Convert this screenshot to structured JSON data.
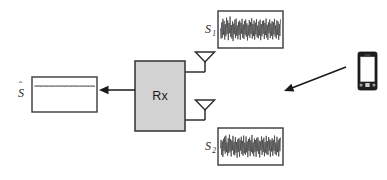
{
  "figure": {
    "background_color": "#ffffff"
  },
  "colors": {
    "rx_block_fill": "#d2d2d2",
    "rx_block_stroke": "#3c3c3c",
    "box_stroke": "#3a3a3a",
    "waveform_stroke": "#404040",
    "arrow_color": "#1a1a1a",
    "phone_body": "#1e1e1e",
    "phone_screen": "#ffffff",
    "text_color": "#1f1f1f"
  },
  "blocks": {
    "receiver": {
      "label": "Rx",
      "name": "receiver-block",
      "x": 135,
      "y": 61,
      "width": 50,
      "height": 70
    }
  },
  "signal_boxes": [
    {
      "id": "s1",
      "label": "S",
      "subscript": "1",
      "hat": "",
      "name": "signal-box-s1",
      "x": 218,
      "y": 11,
      "width": 65,
      "height": 37,
      "label_x": 205,
      "label_y": 33,
      "description": "received noisy signal at antenna 1"
    },
    {
      "id": "s2",
      "label": "S",
      "subscript": "2",
      "hat": "",
      "name": "signal-box-s2",
      "x": 218,
      "y": 128,
      "width": 65,
      "height": 37,
      "label_x": 205,
      "label_y": 150,
      "description": "received noisy signal at antenna 2"
    },
    {
      "id": "shat",
      "label": "S",
      "subscript": "",
      "hat": "ˆ",
      "name": "signal-box-s-hat",
      "x": 32,
      "y": 77,
      "width": 65,
      "height": 35,
      "label_x": 18,
      "label_y": 97,
      "description": "estimated source signal output"
    }
  ],
  "antennas": [
    {
      "id": "antenna-1",
      "name": "antenna-upper",
      "x": 205,
      "y": 52
    },
    {
      "id": "antenna-2",
      "name": "antenna-lower",
      "x": 205,
      "y": 100
    }
  ],
  "arrows": [
    {
      "id": "output-arrow",
      "name": "output-arrow",
      "from_x": 135,
      "from_y": 90,
      "to_x": 99,
      "to_y": 90,
      "width": 1.5,
      "description": "Rx output to estimated signal box"
    },
    {
      "id": "transmit-arrow",
      "name": "transmission-arrow",
      "from_x": 346,
      "from_y": 67,
      "to_x": 284,
      "to_y": 91,
      "width": 1.6,
      "description": "wireless transmission from mobile device"
    }
  ],
  "devices": [
    {
      "id": "mobile-phone",
      "name": "mobile-phone-icon",
      "x": 358,
      "y": 52,
      "width": 19,
      "height": 38,
      "description": "transmitting smartphone"
    }
  ],
  "chart_data": {
    "type": "line",
    "xlabel": "",
    "ylabel": "",
    "grid": false,
    "legend": "none",
    "series": [
      {
        "name": "S1",
        "box": "s1",
        "amplitude": 1.0,
        "samples": [
          0.05,
          -0.62,
          0.48,
          -0.55,
          0.72,
          -0.35,
          0.58,
          -0.68,
          0.35,
          -0.45,
          0.8,
          -0.3,
          0.62,
          -0.72,
          0.44,
          -0.25,
          0.88,
          -0.5,
          0.3,
          -0.62,
          0.55,
          -0.78,
          0.4,
          -0.32,
          0.66,
          -0.58,
          0.74,
          -0.42,
          0.28,
          -0.66,
          0.52,
          -0.38,
          0.6,
          -0.7,
          0.46,
          -0.28,
          0.72,
          -0.55,
          0.34,
          -0.64,
          0.58,
          -0.36,
          0.68,
          -0.48,
          0.42,
          -0.74,
          0.3,
          -0.4,
          0.64,
          -0.56,
          0.5,
          -0.3,
          0.76,
          -0.62,
          0.38,
          -0.44,
          0.6,
          -0.68,
          0.46,
          -0.34,
          0.7,
          -0.52,
          0.26,
          -0.6,
          0.54,
          -0.4,
          0.66,
          -0.72,
          0.36,
          -0.46,
          0.58,
          -0.3,
          0.62,
          -0.64,
          0.44,
          -0.38,
          0.74,
          -0.54,
          0.32,
          -0.7,
          0.48,
          -0.26,
          0.68,
          -0.58,
          0.4,
          -0.42,
          0.56,
          -0.66,
          0.5,
          -0.34,
          0.72,
          -0.48,
          0.28,
          -0.6,
          0.62,
          -0.36,
          0.54,
          -0.7,
          0.38,
          -0.44,
          0.66
        ]
      },
      {
        "name": "S2",
        "box": "s2",
        "amplitude": 1.0,
        "samples": [
          -0.1,
          0.45,
          -0.58,
          0.35,
          -0.7,
          0.52,
          -0.3,
          0.66,
          -0.48,
          0.74,
          -0.38,
          0.28,
          -0.62,
          0.56,
          -0.44,
          0.8,
          -0.34,
          0.5,
          -0.68,
          0.4,
          -0.26,
          0.72,
          -0.54,
          0.32,
          -0.6,
          0.64,
          -0.42,
          0.3,
          -0.76,
          0.48,
          -0.36,
          0.58,
          -0.7,
          0.44,
          -0.28,
          0.66,
          -0.52,
          0.38,
          -0.62,
          0.74,
          -0.46,
          0.26,
          -0.56,
          0.68,
          -0.4,
          0.34,
          -0.72,
          0.5,
          -0.3,
          0.6,
          -0.64,
          0.42,
          -0.38,
          0.78,
          -0.48,
          0.28,
          -0.66,
          0.54,
          -0.36,
          0.44,
          -0.7,
          0.58,
          -0.32,
          0.62,
          -0.5,
          0.4,
          -0.74,
          0.34,
          -0.26,
          0.68,
          -0.56,
          0.46,
          -0.38,
          0.6,
          -0.66,
          0.3,
          -0.42,
          0.72,
          -0.52,
          0.36,
          -0.58,
          0.64,
          -0.28,
          0.48,
          -0.7,
          0.4,
          -0.34,
          0.56,
          -0.62,
          0.44,
          -0.3,
          0.74,
          -0.5,
          0.26,
          -0.6,
          0.66,
          -0.38,
          0.42,
          -0.68,
          0.54,
          -0.32,
          0.58
        ]
      },
      {
        "name": "S-hat",
        "box": "shat",
        "amplitude": 0.22,
        "samples": [
          0.0,
          0.18,
          -0.16,
          0.2,
          -0.14,
          0.17,
          -0.19,
          0.15,
          -0.13,
          0.21,
          -0.17,
          0.14,
          -0.2,
          0.16,
          -0.12,
          0.19,
          -0.18,
          0.13,
          -0.15,
          0.2,
          -0.16,
          0.18,
          -0.14,
          0.12,
          -0.19,
          0.17,
          -0.13,
          0.15,
          -0.2,
          0.14,
          -0.16,
          0.18,
          -0.12,
          0.19,
          -0.17,
          0.13,
          -0.15,
          0.16,
          -0.18,
          0.2,
          -0.14,
          0.12,
          -0.17,
          0.19,
          -0.13,
          0.15,
          -0.2,
          0.16,
          -0.12,
          0.18,
          -0.16,
          0.14,
          -0.19,
          0.17,
          -0.13,
          0.2,
          -0.15,
          0.12,
          -0.18,
          0.16,
          -0.14,
          0.19,
          -0.17,
          0.13,
          -0.15,
          0.18,
          -0.12,
          0.2,
          -0.16,
          0.14,
          -0.19,
          0.15,
          -0.13,
          0.17,
          -0.18,
          0.12,
          -0.16,
          0.2,
          -0.14,
          0.13,
          -0.17,
          0.19,
          -0.15,
          0.12,
          -0.18,
          0.16,
          -0.2,
          0.14,
          -0.13,
          0.17,
          -0.19,
          0.15,
          -0.12,
          0.18,
          -0.16,
          0.13,
          -0.2,
          0.14,
          -0.17,
          0.19,
          -0.15
        ]
      }
    ]
  }
}
